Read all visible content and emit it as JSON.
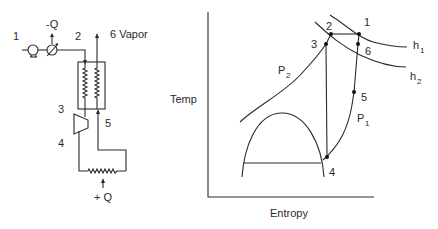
{
  "schematic": {
    "labels": {
      "inlet": "1",
      "after_cooler": "2",
      "hx_out_hot": "3",
      "expander_out": "4",
      "hx_in_cold": "5",
      "vapor_out": "6 Vapor",
      "heat_removed": "-Q",
      "heat_added": "+ Q"
    },
    "components": [
      "pump",
      "cooler",
      "heat-exchanger",
      "expander",
      "heater"
    ]
  },
  "ts_diagram": {
    "axis": {
      "y_label": "Temp",
      "x_label": "Entropy"
    },
    "curve_labels": {
      "p2_main": "P",
      "p2_sub": "2",
      "p1_main": "P",
      "p1_sub": "1",
      "h1_main": "h",
      "h1_sub": "1",
      "h2_main": "h",
      "h2_sub": "2"
    },
    "points": {
      "p1": "1",
      "p2": "2",
      "p3": "3",
      "p4": "4",
      "p5": "5",
      "p6": "6"
    }
  }
}
